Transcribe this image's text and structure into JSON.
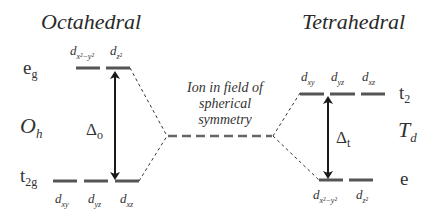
{
  "diagram": {
    "type": "crystal-field-splitting",
    "left": {
      "title": "Octahedral",
      "symmetry": {
        "main": "O",
        "sub": "h"
      },
      "upper_set": {
        "label_main": "e",
        "label_sub": "g",
        "orbitals": [
          {
            "main": "d",
            "sub": "x²−y²"
          },
          {
            "main": "d",
            "sub": "z²"
          }
        ]
      },
      "lower_set": {
        "label_main": "t",
        "label_sub": "2g",
        "orbitals": [
          {
            "main": "d",
            "sub": "xy"
          },
          {
            "main": "d",
            "sub": "yz"
          },
          {
            "main": "d",
            "sub": "xz"
          }
        ]
      },
      "splitting": {
        "main": "Δ",
        "sub": "o"
      }
    },
    "center": {
      "line1": "Ion in field of",
      "line2": "spherical",
      "line3": "symmetry"
    },
    "right": {
      "title": "Tetrahedral",
      "symmetry": {
        "main": "T",
        "sub": "d"
      },
      "upper_set": {
        "label_main": "t",
        "label_sub": "2",
        "orbitals": [
          {
            "main": "d",
            "sub": "xy"
          },
          {
            "main": "d",
            "sub": "yz"
          },
          {
            "main": "d",
            "sub": "xz"
          }
        ]
      },
      "lower_set": {
        "label_main": "e",
        "label_sub": "",
        "orbitals": [
          {
            "main": "d",
            "sub": "x²−y²"
          },
          {
            "main": "d",
            "sub": "z²"
          }
        ]
      },
      "splitting": {
        "main": "Δ",
        "sub": "t"
      }
    },
    "colors": {
      "level": "#555555",
      "arrow": "#1a1a1a",
      "dash": "#333333",
      "text": "#2a2a2a"
    }
  }
}
